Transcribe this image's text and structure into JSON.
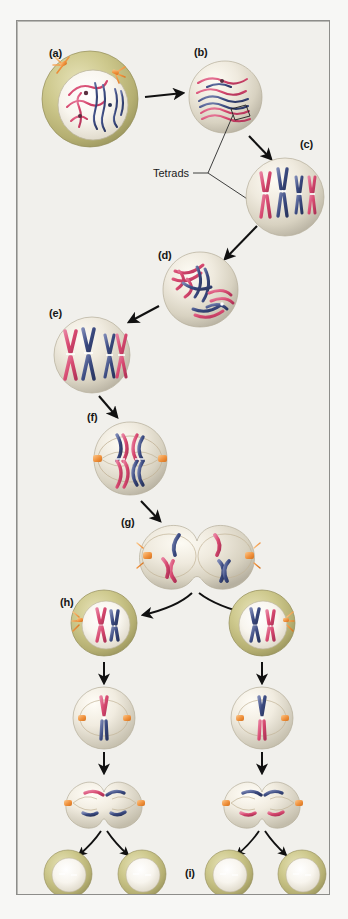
{
  "figure": {
    "background_color": "#f1f0ec",
    "page_color": "#f7f7f5",
    "border_color": "#8d8d8a"
  },
  "palette": {
    "chromosome_pink": "#d6486f",
    "chromosome_pink_light": "#e8839f",
    "chromosome_blue": "#3b4a80",
    "chromosome_blue_light": "#6d7aa8",
    "centriole_orange": "#f0913c",
    "centriole_orange_light": "#f7bc7a",
    "cytoplasm_olive": "#c9c487",
    "cytoplasm_olive_dark": "#a8a268",
    "nucleus_pale": "#efece2",
    "nucleus_shade": "#cdc8b8",
    "spindle_line": "#b9a98f",
    "arrow_black": "#111111",
    "leader_line": "#2a2a2a"
  },
  "labels": {
    "a": "(a)",
    "b": "(b)",
    "c": "(c)",
    "d": "(d)",
    "e": "(e)",
    "f": "(f)",
    "g": "(g)",
    "h": "(h)",
    "i": "(i)",
    "tetrads": "Tetrads"
  },
  "stages": [
    {
      "id": "a",
      "label": "(a)",
      "label_x": 32,
      "label_y": 26,
      "cell_cx": 73,
      "cell_cy": 78,
      "cell_r": 48,
      "type": "cell-with-membrane",
      "description": "Interphase / early prophase I cell with olive cytoplasm, pale nucleus and thin pink and blue chromatin threads, orange centrioles at top"
    },
    {
      "id": "b",
      "label": "(b)",
      "label_x": 177,
      "label_y": 25,
      "cell_cx": 208,
      "cell_cy": 76,
      "cell_r": 36,
      "type": "cell-plain",
      "description": "Prophase I, chromatin condensing into paired homologues (tetrads forming)"
    },
    {
      "id": "c",
      "label": "(c)",
      "label_x": 283,
      "label_y": 117,
      "cell_cx": 272,
      "cell_cy": 175,
      "cell_r": 39,
      "type": "cell-plain",
      "description": "Tetrads fully formed, four pairs of sister chromatids"
    },
    {
      "id": "d",
      "label": "(d)",
      "label_x": 141,
      "label_y": 228,
      "cell_cx": 183,
      "cell_cy": 268,
      "cell_r": 37,
      "type": "cell-plain",
      "description": "Crossing over between non sister chromatids"
    },
    {
      "id": "e",
      "label": "(e)",
      "label_x": 32,
      "label_y": 286,
      "cell_cx": 75,
      "cell_cy": 333,
      "cell_r": 38,
      "type": "cell-plain",
      "description": "Recombined tetrads, four X shaped chromosomes"
    },
    {
      "id": "f",
      "label": "(f)",
      "label_x": 70,
      "label_y": 390,
      "cell_cx": 113,
      "cell_cy": 437,
      "cell_r": 36,
      "type": "cell-spindle",
      "description": "Metaphase I, tetrads aligned at the equator with orange centrioles at both poles"
    },
    {
      "id": "g",
      "label": "(g)",
      "label_x": 104,
      "label_y": 495,
      "cell_cx": 180,
      "cell_cy": 533,
      "cell_r": 42,
      "type": "cell-dumbbell",
      "description": "Telophase I, cell pinching into two with homologues separated"
    },
    {
      "id": "h",
      "label": "(h)",
      "label_x": 43,
      "label_y": 575,
      "cell_cx": 87,
      "cell_cy": 622,
      "cell_r": 33,
      "type": "cell-with-membrane",
      "description": "Two haploid daughter cells after meiosis I, each with one pink and one blue chromosome"
    },
    {
      "id": "i",
      "label": "(i)",
      "label_x": 168,
      "label_y": 852,
      "cell_cx": 0,
      "cell_cy": 0,
      "cell_r": 0,
      "type": "label-only",
      "description": "Four haploid gametes produced at the end of meiosis II"
    }
  ],
  "callouts": [
    {
      "id": "tetrads",
      "text": "Tetrads",
      "text_x": 139,
      "text_y": 147,
      "leader_to": [
        [
          208,
          96
        ],
        [
          266,
          200
        ]
      ]
    }
  ],
  "rows": {
    "meiosis_ii_left_x": 87,
    "meiosis_ii_right_x": 245,
    "telophase_i_y": 622,
    "prophase_ii_y": 700,
    "anaphase_ii_y": 775,
    "gametes_y": 850,
    "gamete_xs": [
      50,
      125,
      212,
      285
    ]
  }
}
